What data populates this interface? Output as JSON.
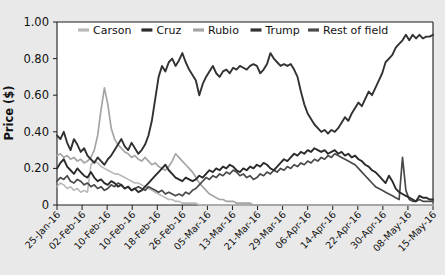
{
  "chart_data": {
    "type": "line",
    "title": "",
    "xlabel": "",
    "ylabel": "Price ($)",
    "ylim": [
      0,
      1.0
    ],
    "yticks": [
      "0",
      "0.20",
      "0.40",
      "0.60",
      "0.80",
      "1.00"
    ],
    "ytick_values": [
      0,
      0.2,
      0.4,
      0.6,
      0.8,
      1.0
    ],
    "grid": false,
    "legend_position": "top-center",
    "x_tick_labels": [
      "25-Jan-16",
      "02-Feb-16",
      "10-Feb-16",
      "10-Feb-16",
      "18-Feb-16",
      "26-Feb-16",
      "05-Mar-16",
      "13-Mar-16",
      "21-Mar-16",
      "29-Mar-16",
      "06-Apr-16",
      "14-Apr-16",
      "22-Apr-16",
      "30-Apr-16",
      "08-May-16",
      "15-May-16"
    ],
    "x_start": "25-Jan-16",
    "x_end": "15-May-16",
    "n_points": 112,
    "series": [
      {
        "name": "Carson",
        "color": "#b9b9b9",
        "values": [
          0.1,
          0.12,
          0.11,
          0.09,
          0.1,
          0.08,
          0.09,
          0.07,
          0.08,
          0.07,
          0.22,
          0.24,
          0.23,
          0.21,
          0.2,
          0.19,
          0.18,
          0.17,
          0.17,
          0.16,
          0.15,
          0.14,
          0.13,
          0.12,
          0.12,
          0.11,
          0.1,
          0.09,
          0.08,
          0.07,
          0.06,
          0.05,
          0.04,
          0.03,
          0.03,
          0.02,
          0.02,
          0.01,
          0.01,
          0.01,
          0.01,
          0.01,
          0.0,
          0.0,
          0.0,
          0.0,
          0.0,
          0.0,
          0.0,
          0.0,
          0.0,
          0.0,
          0.0,
          0.0,
          0.0,
          0.0,
          0.0,
          0.0,
          0.0,
          0.0,
          0.0,
          0.0,
          0.0,
          0.0,
          0.0,
          0.0,
          0.0,
          0.0,
          0.0,
          0.0,
          0.0,
          0.0,
          0.0,
          0.0,
          0.0,
          0.0,
          0.0,
          0.0,
          0.0,
          0.0,
          0.0,
          0.0,
          0.0,
          0.0,
          0.0,
          0.0,
          0.0,
          0.0,
          0.0,
          0.0,
          0.0,
          0.0,
          0.0,
          0.0,
          0.0,
          0.0,
          0.0,
          0.0,
          0.0,
          0.0,
          0.0,
          0.0,
          0.0,
          0.0,
          0.0,
          0.0,
          0.0,
          0.0,
          0.0,
          0.0,
          0.0,
          0.0
        ]
      },
      {
        "name": "Cruz",
        "color": "#2b2b2b",
        "values": [
          0.2,
          0.23,
          0.25,
          0.21,
          0.19,
          0.17,
          0.2,
          0.18,
          0.16,
          0.15,
          0.18,
          0.15,
          0.13,
          0.14,
          0.12,
          0.11,
          0.13,
          0.12,
          0.1,
          0.11,
          0.09,
          0.1,
          0.08,
          0.09,
          0.07,
          0.08,
          0.1,
          0.12,
          0.14,
          0.16,
          0.18,
          0.2,
          0.22,
          0.19,
          0.17,
          0.15,
          0.14,
          0.13,
          0.15,
          0.14,
          0.13,
          0.14,
          0.16,
          0.15,
          0.17,
          0.19,
          0.18,
          0.2,
          0.19,
          0.21,
          0.2,
          0.22,
          0.21,
          0.19,
          0.18,
          0.2,
          0.19,
          0.21,
          0.2,
          0.22,
          0.21,
          0.23,
          0.22,
          0.2,
          0.19,
          0.21,
          0.23,
          0.25,
          0.24,
          0.26,
          0.28,
          0.27,
          0.29,
          0.28,
          0.3,
          0.29,
          0.31,
          0.3,
          0.29,
          0.3,
          0.28,
          0.29,
          0.3,
          0.28,
          0.29,
          0.27,
          0.28,
          0.26,
          0.27,
          0.25,
          0.24,
          0.22,
          0.21,
          0.19,
          0.18,
          0.16,
          0.14,
          0.12,
          0.16,
          0.13,
          0.09,
          0.07,
          0.06,
          0.05,
          0.04,
          0.03,
          0.02,
          0.05,
          0.04,
          0.04,
          0.03,
          0.03
        ]
      },
      {
        "name": "Rubio",
        "color": "#a5a5a5",
        "values": [
          0.27,
          0.28,
          0.26,
          0.27,
          0.25,
          0.26,
          0.24,
          0.25,
          0.23,
          0.24,
          0.26,
          0.3,
          0.38,
          0.52,
          0.64,
          0.55,
          0.42,
          0.36,
          0.33,
          0.31,
          0.29,
          0.28,
          0.26,
          0.27,
          0.25,
          0.24,
          0.26,
          0.24,
          0.22,
          0.23,
          0.21,
          0.2,
          0.19,
          0.21,
          0.24,
          0.28,
          0.26,
          0.24,
          0.22,
          0.2,
          0.18,
          0.15,
          0.12,
          0.1,
          0.08,
          0.06,
          0.05,
          0.04,
          0.03,
          0.03,
          0.02,
          0.02,
          0.02,
          0.01,
          0.01,
          0.01,
          0.01,
          0.01,
          0.0,
          0.0,
          0.0,
          0.0,
          0.0,
          0.0,
          0.0,
          0.0,
          0.0,
          0.0,
          0.0,
          0.0,
          0.0,
          0.0,
          0.0,
          0.0,
          0.0,
          0.0,
          0.0,
          0.0,
          0.0,
          0.0,
          0.0,
          0.0,
          0.0,
          0.0,
          0.0,
          0.0,
          0.0,
          0.0,
          0.0,
          0.0,
          0.0,
          0.0,
          0.0,
          0.0,
          0.0,
          0.0,
          0.0,
          0.0,
          0.0,
          0.0,
          0.0,
          0.0,
          0.0,
          0.0,
          0.0,
          0.0,
          0.0,
          0.0,
          0.0,
          0.0,
          0.0,
          0.0
        ]
      },
      {
        "name": "Trump",
        "color": "#323232",
        "values": [
          0.38,
          0.36,
          0.4,
          0.34,
          0.3,
          0.36,
          0.33,
          0.29,
          0.31,
          0.27,
          0.25,
          0.23,
          0.26,
          0.24,
          0.22,
          0.25,
          0.27,
          0.3,
          0.33,
          0.36,
          0.32,
          0.3,
          0.34,
          0.31,
          0.28,
          0.3,
          0.33,
          0.38,
          0.46,
          0.58,
          0.7,
          0.76,
          0.73,
          0.78,
          0.8,
          0.76,
          0.79,
          0.83,
          0.78,
          0.74,
          0.71,
          0.68,
          0.6,
          0.66,
          0.7,
          0.73,
          0.76,
          0.72,
          0.7,
          0.73,
          0.74,
          0.72,
          0.75,
          0.74,
          0.76,
          0.75,
          0.74,
          0.76,
          0.77,
          0.76,
          0.72,
          0.74,
          0.77,
          0.83,
          0.8,
          0.78,
          0.76,
          0.77,
          0.76,
          0.77,
          0.74,
          0.7,
          0.62,
          0.55,
          0.5,
          0.47,
          0.44,
          0.42,
          0.4,
          0.41,
          0.39,
          0.41,
          0.4,
          0.42,
          0.45,
          0.48,
          0.46,
          0.5,
          0.53,
          0.56,
          0.54,
          0.58,
          0.62,
          0.6,
          0.64,
          0.68,
          0.72,
          0.78,
          0.8,
          0.82,
          0.86,
          0.88,
          0.9,
          0.93,
          0.9,
          0.93,
          0.91,
          0.93,
          0.91,
          0.92,
          0.92,
          0.93
        ]
      },
      {
        "name": "Rest of field",
        "color": "#4a4a4a",
        "values": [
          0.13,
          0.15,
          0.14,
          0.16,
          0.13,
          0.12,
          0.14,
          0.13,
          0.11,
          0.12,
          0.1,
          0.11,
          0.09,
          0.1,
          0.08,
          0.09,
          0.11,
          0.1,
          0.12,
          0.11,
          0.09,
          0.1,
          0.08,
          0.09,
          0.1,
          0.09,
          0.08,
          0.1,
          0.09,
          0.08,
          0.07,
          0.08,
          0.06,
          0.07,
          0.06,
          0.05,
          0.06,
          0.05,
          0.07,
          0.06,
          0.08,
          0.09,
          0.11,
          0.13,
          0.15,
          0.14,
          0.16,
          0.15,
          0.17,
          0.16,
          0.18,
          0.17,
          0.19,
          0.18,
          0.16,
          0.17,
          0.15,
          0.16,
          0.14,
          0.15,
          0.17,
          0.16,
          0.18,
          0.17,
          0.19,
          0.18,
          0.2,
          0.19,
          0.21,
          0.2,
          0.22,
          0.21,
          0.23,
          0.22,
          0.24,
          0.23,
          0.25,
          0.24,
          0.26,
          0.25,
          0.27,
          0.26,
          0.28,
          0.27,
          0.26,
          0.25,
          0.24,
          0.23,
          0.22,
          0.2,
          0.18,
          0.16,
          0.14,
          0.12,
          0.1,
          0.09,
          0.08,
          0.07,
          0.06,
          0.05,
          0.04,
          0.03,
          0.26,
          0.08,
          0.03,
          0.02,
          0.02,
          0.03,
          0.02,
          0.02,
          0.02,
          0.02
        ]
      }
    ]
  },
  "legend": {
    "items": [
      {
        "label": "Carson"
      },
      {
        "label": "Cruz"
      },
      {
        "label": "Rubio"
      },
      {
        "label": "Trump"
      },
      {
        "label": "Rest of field"
      }
    ]
  }
}
